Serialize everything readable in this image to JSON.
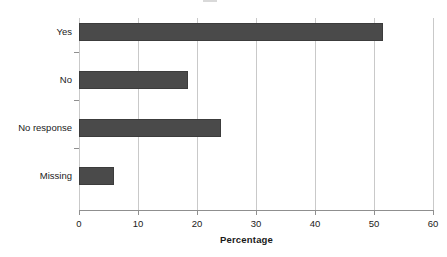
{
  "chart_data": {
    "type": "bar",
    "orientation": "horizontal",
    "title": "",
    "xlabel": "Percentage",
    "ylabel": "",
    "categories": [
      "Yes",
      "No",
      "No response",
      "Missing"
    ],
    "values": [
      51.5,
      18.4,
      24.1,
      5.9
    ],
    "xlim": [
      0,
      60
    ],
    "xticks": [
      0,
      10,
      20,
      30,
      40,
      50,
      60
    ],
    "xticklabels": [
      "0",
      "10",
      "20",
      "30",
      "40",
      "50",
      "60"
    ],
    "grid": "vertical",
    "legend": "none",
    "bar_color": "#4a4a4a",
    "bar_edge_color": "#3c3c3c",
    "gridline_color": "#c9c9c9",
    "axis_color": "#8f8f8f",
    "background_color": "#ffffff",
    "annotations": []
  },
  "axes": {
    "x_title": "Percentage",
    "tick_labels": [
      "0",
      "10",
      "20",
      "30",
      "40",
      "50",
      "60"
    ],
    "category_labels": [
      "Yes",
      "No",
      "No response",
      "Missing"
    ]
  },
  "figure": {
    "title_remnant": "Figure"
  }
}
